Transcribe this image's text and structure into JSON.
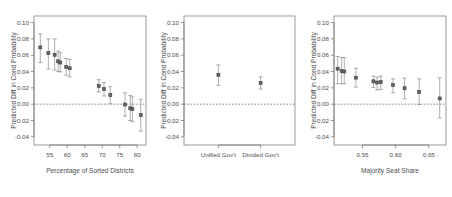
{
  "figure": {
    "background": "#ffffff",
    "point_color": "#666666",
    "ci_color": "#8c8c8c",
    "axis_color": "#6e6e6e",
    "zero_line_color": "#555555"
  },
  "chart_data": [
    {
      "type": "scatter",
      "panel": 1,
      "title": "",
      "xlabel": "Percentage of Sorted Districts",
      "ylabel": "Predicted Diff in Cond Probability",
      "xlim": [
        50.5,
        82.5
      ],
      "ylim": [
        -0.05,
        0.108
      ],
      "xticks": [
        55,
        60,
        65,
        70,
        75,
        80
      ],
      "xticklabels": [
        "55",
        "60",
        "65",
        "70",
        "75",
        "80"
      ],
      "yticks": [
        -0.04,
        -0.02,
        0.0,
        0.02,
        0.04,
        0.06,
        0.08,
        0.1
      ],
      "yticklabels": [
        "-0.04",
        "-0.02",
        "0.00",
        "0.02",
        "0.04",
        "0.06",
        "0.08",
        "0.10"
      ],
      "grid": false,
      "legend": "none",
      "annotations": [
        "horizontal dashed reference line at y = 0.00"
      ],
      "series": [
        {
          "name": "Predicted difference with 95% CI",
          "x": [
            52.3,
            54.6,
            56.4,
            57.4,
            58.0,
            59.7,
            60.7,
            69.0,
            70.5,
            72.3,
            76.5,
            78.0,
            78.6,
            81.0
          ],
          "y": [
            0.0695,
            0.0625,
            0.0605,
            0.0525,
            0.051,
            0.0455,
            0.044,
            0.0225,
            0.0185,
            0.011,
            -0.0005,
            -0.005,
            -0.006,
            -0.0135
          ],
          "ci_low": [
            0.051,
            0.043,
            0.042,
            0.04,
            0.0395,
            0.0355,
            0.0335,
            0.015,
            0.01,
            0.0005,
            -0.0145,
            -0.02,
            -0.0215,
            -0.033
          ],
          "ci_high": [
            0.086,
            0.08,
            0.08,
            0.065,
            0.063,
            0.056,
            0.055,
            0.03,
            0.0265,
            0.0215,
            0.014,
            0.0105,
            0.009,
            0.006
          ]
        }
      ]
    },
    {
      "type": "scatter",
      "panel": 2,
      "title": "",
      "xlabel": "",
      "ylabel": "Predicted Diff in Cond Probability",
      "xlim": [
        0,
        2
      ],
      "ylim": [
        -0.05,
        0.108
      ],
      "xticks": [
        0.62,
        1.38
      ],
      "xticklabels": [
        "Unified Gov't",
        "Divided Gov't"
      ],
      "yticks": [
        -0.04,
        -0.02,
        0.0,
        0.02,
        0.04,
        0.06,
        0.08,
        0.1
      ],
      "yticklabels": [
        "-0.04",
        "-0.02",
        "0.00",
        "0.02",
        "0.04",
        "0.06",
        "0.08",
        "0.10"
      ],
      "grid": false,
      "legend": "none",
      "annotations": [
        "horizontal dashed reference line at y = 0.00"
      ],
      "series": [
        {
          "name": "Predicted difference with 95% CI",
          "categories": [
            "Unified Gov't",
            "Divided Gov't"
          ],
          "x": [
            0.62,
            1.38
          ],
          "y": [
            0.036,
            0.026
          ],
          "ci_low": [
            0.023,
            0.0185
          ],
          "ci_high": [
            0.048,
            0.0335
          ]
        }
      ]
    },
    {
      "type": "scatter",
      "panel": 3,
      "title": "",
      "xlabel": "Majority Seat Share",
      "ylabel": "Predicted Diff in Cond Probability",
      "xlim": [
        0.507,
        0.676
      ],
      "ylim": [
        -0.05,
        0.108
      ],
      "xticks": [
        0.55,
        0.6,
        0.65
      ],
      "xticklabels": [
        "0.55",
        "0.60",
        "0.65"
      ],
      "yticks": [
        -0.04,
        -0.02,
        0.0,
        0.02,
        0.04,
        0.06,
        0.08,
        0.1
      ],
      "yticklabels": [
        "-0.04",
        "-0.02",
        "0.00",
        "0.02",
        "0.04",
        "0.06",
        "0.08",
        "0.10"
      ],
      "grid": false,
      "legend": "none",
      "annotations": [
        "horizontal dashed reference line at y = 0.00"
      ],
      "series": [
        {
          "name": "Predicted difference with 95% CI",
          "x": [
            0.5125,
            0.5185,
            0.5225,
            0.54,
            0.5665,
            0.572,
            0.5775,
            0.596,
            0.6135,
            0.6355,
            0.6665
          ],
          "y": [
            0.0435,
            0.0405,
            0.04,
            0.0325,
            0.028,
            0.0265,
            0.027,
            0.0235,
            0.0195,
            0.015,
            0.007
          ],
          "ci_low": [
            0.025,
            0.025,
            0.025,
            0.021,
            0.0205,
            0.0175,
            0.018,
            0.014,
            0.0065,
            -0.0005,
            -0.017
          ],
          "ci_high": [
            0.0585,
            0.057,
            0.057,
            0.044,
            0.0345,
            0.033,
            0.0345,
            0.031,
            0.032,
            0.031,
            0.0325
          ]
        }
      ]
    }
  ]
}
